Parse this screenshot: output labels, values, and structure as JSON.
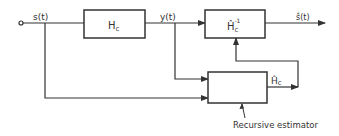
{
  "diagram": {
    "input_signal": "s(t)",
    "channel_block": {
      "main": "H",
      "sub": "c"
    },
    "channel_output": "y(t)",
    "inverse_block": {
      "main": "Ĥ",
      "sub": "c",
      "sup": "-1"
    },
    "output_signal": "ŝ(t)",
    "estimate_label": {
      "main": "Ĥ",
      "sub": "c"
    },
    "estimator_caption": "Recursive estimator",
    "line_color": "#333333"
  }
}
